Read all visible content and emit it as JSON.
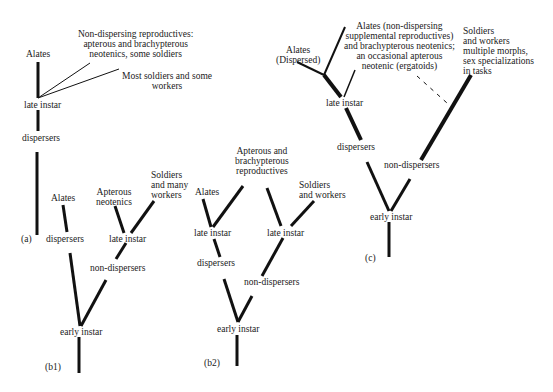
{
  "panels": {
    "a": {
      "tag": "(a)",
      "alates": "Alates",
      "non_dispersing": "Non-dispersing reproductives:\napterous and brachypterous\nneotenics, some soldiers",
      "most_soldiers": "Most soldiers and some\nworkers",
      "late_instar": "late instar",
      "dispersers": "dispersers"
    },
    "b1": {
      "tag": "(b1)",
      "alates": "Alates",
      "apterous": "Apterous\nneotenics",
      "soldiers": "Soldiers\nand many\nworkers",
      "late_instar": "late instar",
      "dispersers": "dispersers",
      "non_dispersers": "non-dispersers",
      "early_instar": "early instar"
    },
    "b2": {
      "tag": "(b2)",
      "apterous": "Apterous and\nbrachypterous\nreproductives",
      "alates": "Alates",
      "soldiers": "Soldiers\nand workers",
      "late_instar_left": "late instar",
      "late_instar_right": "late instar",
      "dispersers": "dispersers",
      "non_dispersers": "non-dispersers",
      "early_instar": "early instar"
    },
    "c": {
      "tag": "(c)",
      "alates_dispersed": "Alates\n(Dispersed)",
      "alates_non_dispersing": "Alates (non-dispersing\nsupplemental reproductives)\nand brachypterous neotenics;\nan occasional apterous\nneotenic (ergatoids)",
      "soldiers": "Soldiers\nand workers\nmultiple morphs,\nsex specializations\nin tasks",
      "late_instar": "late instar",
      "dispersers": "dispersers",
      "non_dispersers": "non-dispersers",
      "early_instar": "early instar"
    }
  },
  "colors": {
    "line": "#111111",
    "text": "#1a1a1a"
  }
}
